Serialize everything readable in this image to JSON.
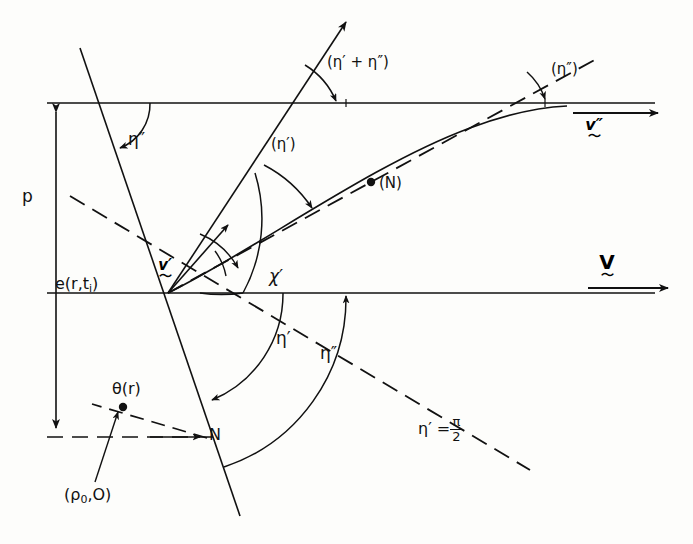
{
  "figure": {
    "type": "scattering-geometry-diagram",
    "background": "#fdfdfb",
    "ink": "#111111",
    "width": 693,
    "height": 544
  },
  "labels": {
    "p": "p",
    "e_field": "e(r,t",
    "e_field_sub": "i",
    "e_field_close": ")",
    "eta2_upper_left": "η″",
    "eta_sum": "(η′ + η″)",
    "eta2_paren_right": "(η″)",
    "eta1_paren": "(η′)",
    "n_paren": "(N)",
    "v_prime": "v′",
    "chi_prime": "χ′",
    "eta1_lower": "η′",
    "eta2_lower": "η″",
    "theta_r": "θ(r)",
    "rho_zero": "(ρ",
    "rho_zero_sub": "0",
    "rho_zero_tail": ",O)",
    "n_point": "N",
    "eta_eq": "η′ =",
    "eta_eq_num": "π",
    "eta_eq_den": "2",
    "v_double_prime_vec": "v″",
    "v_vec": "V",
    "tilde": "～"
  },
  "icon_names": {
    "arrow_head": "arrow-head-icon",
    "dot": "point-marker-icon"
  }
}
